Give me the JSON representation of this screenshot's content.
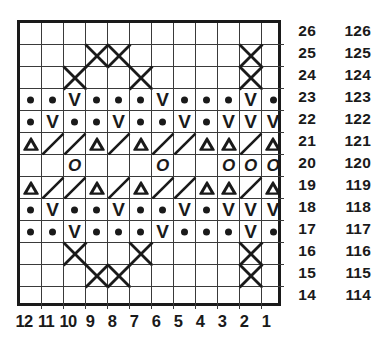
{
  "chart_data": {
    "type": "table",
    "grid": {
      "columns": 12,
      "rows": 13
    },
    "column_headers": [
      "12",
      "11",
      "10",
      "9",
      "8",
      "7",
      "6",
      "5",
      "4",
      "3",
      "2",
      "1"
    ],
    "row_headers_primary": [
      "26",
      "25",
      "24",
      "23",
      "22",
      "21",
      "20",
      "19",
      "18",
      "17",
      "16",
      "15",
      "14"
    ],
    "row_headers_secondary": [
      "126",
      "125",
      "124",
      "123",
      "122",
      "121",
      "120",
      "119",
      "118",
      "117",
      "116",
      "115",
      "114"
    ],
    "legend_symbols": {
      "dot": "purl-dot",
      "vee": "slip-stitch-v",
      "oh": "yarn-over-o",
      "tri": "decrease-triangle",
      "slash": "right-slant-line",
      "xl": "cable-cross-x-left-half",
      "xr": "cable-cross-x-right-half",
      "x": "cable-cross-x",
      "blank": "empty-knit"
    },
    "comment_cell_order": "each row array is left-to-right on screen = column 12 down to column 1",
    "rows": [
      {
        "label": "26",
        "label2": "126",
        "cells": [
          "blank",
          "blank",
          "blank",
          "blank",
          "blank",
          "blank",
          "blank",
          "blank",
          "blank",
          "blank",
          "blank",
          "blank"
        ]
      },
      {
        "label": "25",
        "label2": "125",
        "cells": [
          "blank",
          "blank",
          "blank",
          "x",
          "x",
          "blank",
          "blank",
          "blank",
          "blank",
          "blank",
          "x",
          "blank"
        ]
      },
      {
        "label": "24",
        "label2": "124",
        "cells": [
          "blank",
          "blank",
          "x",
          "blank",
          "blank",
          "x",
          "blank",
          "blank",
          "blank",
          "blank",
          "x",
          "blank"
        ]
      },
      {
        "label": "23",
        "label2": "123",
        "cells": [
          "dot",
          "dot",
          "vee",
          "dot",
          "dot",
          "dot",
          "vee",
          "dot",
          "dot",
          "dot",
          "vee",
          "dot"
        ]
      },
      {
        "label": "22",
        "label2": "122",
        "cells": [
          "dot",
          "vee",
          "dot",
          "dot",
          "vee",
          "dot",
          "dot",
          "vee",
          "dot",
          "vee",
          "vee",
          "vee"
        ]
      },
      {
        "label": "21",
        "label2": "121",
        "cells": [
          "tri",
          "slash",
          "slash",
          "tri",
          "slash",
          "tri",
          "slash",
          "slash",
          "tri",
          "tri",
          "slash",
          "tri"
        ]
      },
      {
        "label": "20",
        "label2": "120",
        "cells": [
          "blank",
          "blank",
          "oh",
          "blank",
          "blank",
          "blank",
          "oh",
          "blank",
          "blank",
          "oh",
          "oh",
          "oh"
        ]
      },
      {
        "label": "19",
        "label2": "119",
        "cells": [
          "tri",
          "slash",
          "slash",
          "tri",
          "slash",
          "tri",
          "slash",
          "slash",
          "tri",
          "tri",
          "slash",
          "tri"
        ]
      },
      {
        "label": "18",
        "label2": "118",
        "cells": [
          "dot",
          "vee",
          "dot",
          "dot",
          "vee",
          "dot",
          "dot",
          "vee",
          "dot",
          "vee",
          "vee",
          "vee"
        ]
      },
      {
        "label": "17",
        "label2": "117",
        "cells": [
          "dot",
          "dot",
          "vee",
          "dot",
          "dot",
          "dot",
          "vee",
          "dot",
          "dot",
          "dot",
          "vee",
          "dot"
        ]
      },
      {
        "label": "16",
        "label2": "116",
        "cells": [
          "blank",
          "blank",
          "x",
          "blank",
          "blank",
          "x",
          "blank",
          "blank",
          "blank",
          "blank",
          "x",
          "blank"
        ]
      },
      {
        "label": "15",
        "label2": "115",
        "cells": [
          "blank",
          "blank",
          "blank",
          "x",
          "x",
          "blank",
          "blank",
          "blank",
          "blank",
          "blank",
          "x",
          "blank"
        ]
      },
      {
        "label": "14",
        "label2": "114",
        "cells": [
          "blank",
          "blank",
          "blank",
          "blank",
          "blank",
          "blank",
          "blank",
          "blank",
          "blank",
          "blank",
          "blank",
          "blank"
        ]
      }
    ]
  },
  "colors": {
    "ink": "#1a1a1a",
    "grid_line": "#3a3a3a",
    "background": "#ffffff"
  }
}
